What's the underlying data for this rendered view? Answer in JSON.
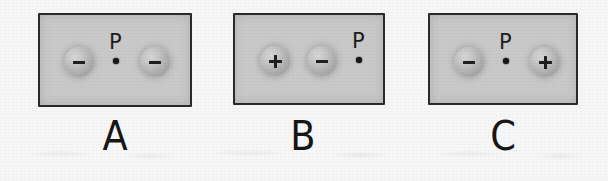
{
  "figure": {
    "type": "physics-diagram",
    "background_color": "#f7f7f7",
    "box_fill_color": "#c9c9c9",
    "box_border_color": "#2b2b2b",
    "charge_body_color": "#b8b8b8",
    "sign_color": "#1f1f1f",
    "label_color": "#161616",
    "point_label": "P"
  },
  "panels": [
    {
      "label": "A",
      "box": {
        "x": 38,
        "y": 13,
        "width": 154,
        "height": 94
      },
      "label_pos": {
        "x": 95,
        "y": 116,
        "width": 40
      },
      "items": [
        {
          "kind": "charge",
          "sign": "-",
          "sign_glyph": "−",
          "name": "charge-negative-left",
          "x": 62,
          "y": 45
        },
        {
          "kind": "point",
          "sign": "P",
          "name": "field-point-p",
          "x": 107,
          "y": 30
        },
        {
          "kind": "charge",
          "sign": "-",
          "sign_glyph": "−",
          "name": "charge-negative-right",
          "x": 138,
          "y": 45
        }
      ]
    },
    {
      "label": "B",
      "box": {
        "x": 233,
        "y": 13,
        "width": 152,
        "height": 92
      },
      "label_pos": {
        "x": 283,
        "y": 116,
        "width": 40
      },
      "items": [
        {
          "kind": "charge",
          "sign": "+",
          "sign_glyph": "+",
          "name": "charge-positive-left",
          "x": 258,
          "y": 44
        },
        {
          "kind": "charge",
          "sign": "-",
          "sign_glyph": "−",
          "name": "charge-negative-middle",
          "x": 305,
          "y": 44
        },
        {
          "kind": "point",
          "sign": "P",
          "name": "field-point-p",
          "x": 350,
          "y": 29
        }
      ]
    },
    {
      "label": "C",
      "box": {
        "x": 428,
        "y": 13,
        "width": 150,
        "height": 92
      },
      "label_pos": {
        "x": 483,
        "y": 116,
        "width": 40
      },
      "items": [
        {
          "kind": "charge",
          "sign": "-",
          "sign_glyph": "−",
          "name": "charge-negative-left",
          "x": 452,
          "y": 45
        },
        {
          "kind": "point",
          "sign": "P",
          "name": "field-point-p",
          "x": 497,
          "y": 30
        },
        {
          "kind": "charge",
          "sign": "+",
          "sign_glyph": "+",
          "name": "charge-positive-right",
          "x": 528,
          "y": 45
        }
      ]
    }
  ]
}
